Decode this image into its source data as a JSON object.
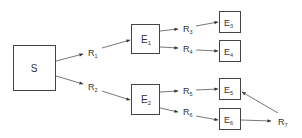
{
  "diagram": {
    "nodes": {
      "S": {
        "label": "S",
        "sub": ""
      },
      "E1": {
        "label": "E",
        "sub": "1"
      },
      "E2": {
        "label": "E",
        "sub": "2"
      },
      "E3": {
        "label": "E",
        "sub": "3"
      },
      "E4": {
        "label": "E",
        "sub": "4"
      },
      "E5": {
        "label": "E",
        "sub": "5"
      },
      "E6": {
        "label": "E",
        "sub": "6"
      }
    },
    "relations": {
      "R1": {
        "label": "R",
        "sub": "1"
      },
      "R2": {
        "label": "R",
        "sub": "2"
      },
      "R3": {
        "label": "R",
        "sub": "3"
      },
      "R4": {
        "label": "R",
        "sub": "4"
      },
      "R5": {
        "label": "R",
        "sub": "5"
      },
      "R6": {
        "label": "R",
        "sub": "6"
      },
      "R7": {
        "label": "R",
        "sub": "7"
      }
    },
    "edges": [
      {
        "from": "S",
        "via": "R1",
        "to": "E1"
      },
      {
        "from": "S",
        "via": "R2",
        "to": "E2"
      },
      {
        "from": "E1",
        "via": "R3",
        "to": "E3"
      },
      {
        "from": "E1",
        "via": "R4",
        "to": "E4"
      },
      {
        "from": "E2",
        "via": "R5",
        "to": "E5"
      },
      {
        "from": "E2",
        "via": "R6",
        "to": "E6"
      },
      {
        "from": "E6",
        "via": "R7",
        "to": "E5"
      }
    ],
    "colors": {
      "stroke": "#444444",
      "text": "#333333",
      "background": "#ffffff"
    }
  }
}
